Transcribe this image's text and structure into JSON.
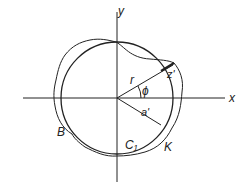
{
  "diagram": {
    "axes": {
      "x_label": "x",
      "y_label": "y"
    },
    "labels": {
      "radius": "r",
      "angle": "ϕ",
      "displacement": "z'",
      "mean_radius": "a'",
      "outer_curve": "B",
      "circle": "C₁",
      "inner_curve": "K"
    },
    "colors": {
      "stroke": "#222222",
      "background": "#ffffff"
    }
  }
}
